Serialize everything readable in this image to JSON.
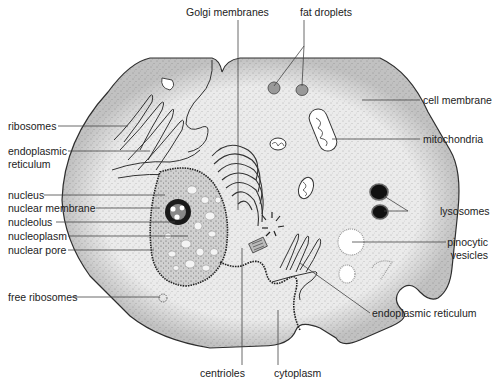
{
  "diagram": {
    "labels": {
      "golgi": "Golgi membranes",
      "fat": "fat droplets",
      "cell_membrane": "cell membrane",
      "ribosomes": "ribosomes",
      "mitochondria": "mitochondria",
      "er_top_1": "endoplasmic",
      "er_top_2": "reticulum",
      "nucleus": "nucleus",
      "nuclear_membrane": "nuclear membrane",
      "nucleolus": "nucleolus",
      "nucleoplasm": "nucleoplasm",
      "nuclear_pore": "nuclear pore",
      "lysosomes": "lysosomes",
      "pinocytic_1": "pinocytic",
      "pinocytic_2": "vesicles",
      "free_ribosomes": "free ribosomes",
      "er_bottom": "endoplasmic reticulum",
      "centrioles": "centrioles",
      "cytoplasm": "cytoplasm"
    },
    "colors": {
      "cytoplasm_fill": "#e6e6e6",
      "outline": "#333333",
      "leader_line": "#444444",
      "lysosome": "#0a0a0a",
      "vesicle": "#ffffff"
    }
  }
}
